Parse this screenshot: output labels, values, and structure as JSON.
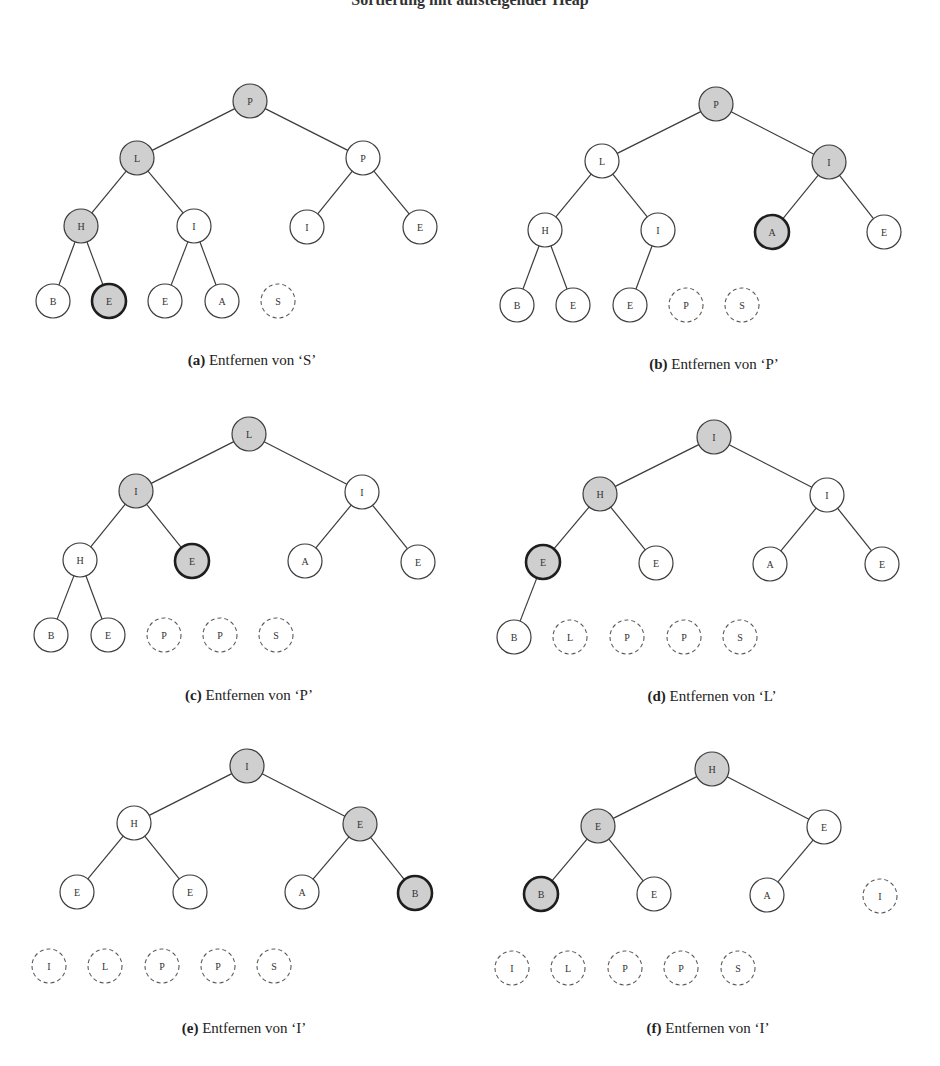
{
  "title": "Sortierung mit aufsteigender Heap",
  "style": {
    "gray_fill": "#cfcfcf",
    "white_fill": "#ffffff",
    "stroke": "#3c3c3c",
    "dashed_stroke": "#5a5a5a",
    "node_radius": 17
  },
  "panels": [
    {
      "id": "a",
      "caption_label": "(a)",
      "caption_text": " Entfernen von ‘S’",
      "caption_pos": [
        252,
        352
      ],
      "nodes": [
        {
          "label": "P",
          "x": 250,
          "y": 101,
          "type": "gray"
        },
        {
          "label": "L",
          "x": 137,
          "y": 158,
          "type": "gray"
        },
        {
          "label": "P",
          "x": 363,
          "y": 158,
          "type": "white"
        },
        {
          "label": "H",
          "x": 81,
          "y": 226,
          "type": "gray"
        },
        {
          "label": "I",
          "x": 194,
          "y": 226,
          "type": "white"
        },
        {
          "label": "I",
          "x": 307,
          "y": 227,
          "type": "white"
        },
        {
          "label": "E",
          "x": 420,
          "y": 227,
          "type": "white"
        },
        {
          "label": "B",
          "x": 53,
          "y": 301,
          "type": "white"
        },
        {
          "label": "E",
          "x": 109,
          "y": 301,
          "type": "highlight"
        },
        {
          "label": "E",
          "x": 165,
          "y": 301,
          "type": "white"
        },
        {
          "label": "A",
          "x": 222,
          "y": 301,
          "type": "white"
        },
        {
          "label": "S",
          "x": 278,
          "y": 301,
          "type": "dashed"
        }
      ],
      "edges": [
        [
          0,
          1
        ],
        [
          0,
          2
        ],
        [
          1,
          3
        ],
        [
          1,
          4
        ],
        [
          2,
          5
        ],
        [
          2,
          6
        ],
        [
          3,
          7
        ],
        [
          3,
          8
        ],
        [
          4,
          9
        ],
        [
          4,
          10
        ]
      ]
    },
    {
      "id": "b",
      "caption_label": "(b)",
      "caption_text": " Entfernen von ‘P’",
      "caption_pos": [
        714,
        356
      ],
      "nodes": [
        {
          "label": "P",
          "x": 716,
          "y": 104,
          "type": "gray"
        },
        {
          "label": "L",
          "x": 602,
          "y": 161,
          "type": "white"
        },
        {
          "label": "I",
          "x": 829,
          "y": 162,
          "type": "gray"
        },
        {
          "label": "H",
          "x": 545,
          "y": 230,
          "type": "white"
        },
        {
          "label": "I",
          "x": 658,
          "y": 230,
          "type": "white"
        },
        {
          "label": "A",
          "x": 772,
          "y": 232,
          "type": "highlight"
        },
        {
          "label": "E",
          "x": 884,
          "y": 232,
          "type": "white"
        },
        {
          "label": "B",
          "x": 517,
          "y": 305,
          "type": "white"
        },
        {
          "label": "E",
          "x": 573,
          "y": 305,
          "type": "white"
        },
        {
          "label": "E",
          "x": 630,
          "y": 305,
          "type": "white"
        },
        {
          "label": "P",
          "x": 686,
          "y": 305,
          "type": "dashed"
        },
        {
          "label": "S",
          "x": 742,
          "y": 305,
          "type": "dashed"
        }
      ],
      "edges": [
        [
          0,
          1
        ],
        [
          0,
          2
        ],
        [
          1,
          3
        ],
        [
          1,
          4
        ],
        [
          2,
          5
        ],
        [
          2,
          6
        ],
        [
          3,
          7
        ],
        [
          3,
          8
        ],
        [
          4,
          9
        ]
      ]
    },
    {
      "id": "c",
      "caption_label": "(c)",
      "caption_text": " Entfernen von ‘P’",
      "caption_pos": [
        249,
        687
      ],
      "nodes": [
        {
          "label": "L",
          "x": 249,
          "y": 434,
          "type": "gray"
        },
        {
          "label": "I",
          "x": 136,
          "y": 491,
          "type": "gray"
        },
        {
          "label": "I",
          "x": 362,
          "y": 492,
          "type": "white"
        },
        {
          "label": "H",
          "x": 80,
          "y": 560,
          "type": "white"
        },
        {
          "label": "E",
          "x": 192,
          "y": 561,
          "type": "highlight"
        },
        {
          "label": "A",
          "x": 305,
          "y": 561,
          "type": "white"
        },
        {
          "label": "E",
          "x": 418,
          "y": 562,
          "type": "white"
        },
        {
          "label": "B",
          "x": 51,
          "y": 635,
          "type": "white"
        },
        {
          "label": "E",
          "x": 108,
          "y": 635,
          "type": "white"
        },
        {
          "label": "P",
          "x": 164,
          "y": 635,
          "type": "dashed"
        },
        {
          "label": "P",
          "x": 220,
          "y": 635,
          "type": "dashed"
        },
        {
          "label": "S",
          "x": 276,
          "y": 635,
          "type": "dashed"
        }
      ],
      "edges": [
        [
          0,
          1
        ],
        [
          0,
          2
        ],
        [
          1,
          3
        ],
        [
          1,
          4
        ],
        [
          2,
          5
        ],
        [
          2,
          6
        ],
        [
          3,
          7
        ],
        [
          3,
          8
        ]
      ]
    },
    {
      "id": "d",
      "caption_label": "(d)",
      "caption_text": " Entfernen von ‘L’",
      "caption_pos": [
        712,
        688
      ],
      "nodes": [
        {
          "label": "I",
          "x": 714,
          "y": 437,
          "type": "gray"
        },
        {
          "label": "H",
          "x": 600,
          "y": 494,
          "type": "gray"
        },
        {
          "label": "I",
          "x": 827,
          "y": 495,
          "type": "white"
        },
        {
          "label": "E",
          "x": 543,
          "y": 562,
          "type": "highlight"
        },
        {
          "label": "E",
          "x": 656,
          "y": 563,
          "type": "white"
        },
        {
          "label": "A",
          "x": 770,
          "y": 564,
          "type": "white"
        },
        {
          "label": "E",
          "x": 882,
          "y": 564,
          "type": "white"
        },
        {
          "label": "B",
          "x": 514,
          "y": 637,
          "type": "white"
        },
        {
          "label": "L",
          "x": 570,
          "y": 637,
          "type": "dashed"
        },
        {
          "label": "P",
          "x": 627,
          "y": 637,
          "type": "dashed"
        },
        {
          "label": "P",
          "x": 684,
          "y": 637,
          "type": "dashed"
        },
        {
          "label": "S",
          "x": 740,
          "y": 637,
          "type": "dashed"
        }
      ],
      "edges": [
        [
          0,
          1
        ],
        [
          0,
          2
        ],
        [
          1,
          3
        ],
        [
          1,
          4
        ],
        [
          2,
          5
        ],
        [
          2,
          6
        ],
        [
          3,
          7
        ]
      ]
    },
    {
      "id": "e",
      "caption_label": "(e)",
      "caption_text": " Entfernen von ‘I’",
      "caption_pos": [
        244,
        1020
      ],
      "nodes": [
        {
          "label": "I",
          "x": 247,
          "y": 766,
          "type": "gray"
        },
        {
          "label": "H",
          "x": 134,
          "y": 823,
          "type": "white"
        },
        {
          "label": "E",
          "x": 360,
          "y": 824,
          "type": "gray"
        },
        {
          "label": "E",
          "x": 77,
          "y": 892,
          "type": "white"
        },
        {
          "label": "E",
          "x": 190,
          "y": 892,
          "type": "white"
        },
        {
          "label": "A",
          "x": 302,
          "y": 892,
          "type": "white"
        },
        {
          "label": "B",
          "x": 415,
          "y": 893,
          "type": "highlight"
        },
        {
          "label": "I",
          "x": 49,
          "y": 966,
          "type": "dashed"
        },
        {
          "label": "L",
          "x": 105,
          "y": 966,
          "type": "dashed"
        },
        {
          "label": "P",
          "x": 162,
          "y": 966,
          "type": "dashed"
        },
        {
          "label": "P",
          "x": 218,
          "y": 966,
          "type": "dashed"
        },
        {
          "label": "S",
          "x": 274,
          "y": 966,
          "type": "dashed"
        }
      ],
      "edges": [
        [
          0,
          1
        ],
        [
          0,
          2
        ],
        [
          1,
          3
        ],
        [
          1,
          4
        ],
        [
          2,
          5
        ],
        [
          2,
          6
        ]
      ]
    },
    {
      "id": "f",
      "caption_label": "(f)",
      "caption_text": " Entfernen von ‘I’",
      "caption_pos": [
        708,
        1020
      ],
      "nodes": [
        {
          "label": "H",
          "x": 712,
          "y": 769,
          "type": "gray"
        },
        {
          "label": "E",
          "x": 598,
          "y": 826,
          "type": "gray"
        },
        {
          "label": "E",
          "x": 824,
          "y": 827,
          "type": "white"
        },
        {
          "label": "B",
          "x": 541,
          "y": 894,
          "type": "highlight"
        },
        {
          "label": "E",
          "x": 654,
          "y": 894,
          "type": "white"
        },
        {
          "label": "A",
          "x": 767,
          "y": 895,
          "type": "white"
        },
        {
          "label": "I",
          "x": 880,
          "y": 896,
          "type": "dashed"
        },
        {
          "label": "I",
          "x": 512,
          "y": 968,
          "type": "dashed"
        },
        {
          "label": "L",
          "x": 568,
          "y": 968,
          "type": "dashed"
        },
        {
          "label": "P",
          "x": 625,
          "y": 968,
          "type": "dashed"
        },
        {
          "label": "P",
          "x": 681,
          "y": 968,
          "type": "dashed"
        },
        {
          "label": "S",
          "x": 738,
          "y": 968,
          "type": "dashed"
        }
      ],
      "edges": [
        [
          0,
          1
        ],
        [
          0,
          2
        ],
        [
          1,
          3
        ],
        [
          1,
          4
        ],
        [
          2,
          5
        ]
      ]
    }
  ]
}
